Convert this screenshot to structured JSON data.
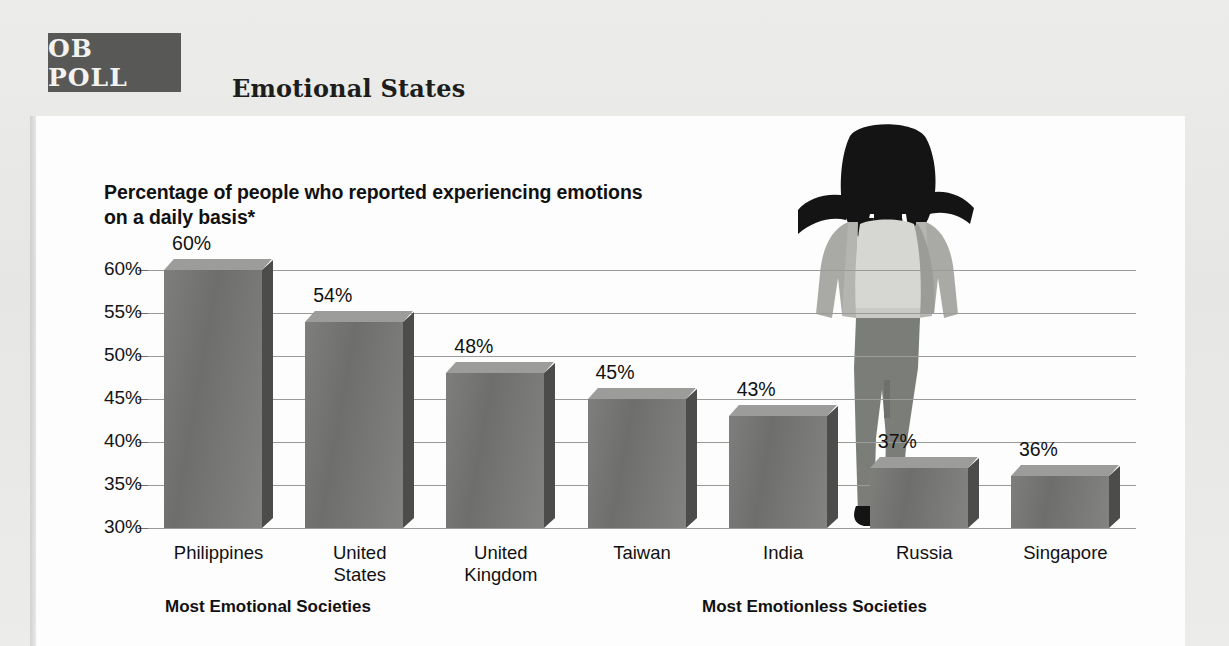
{
  "badge": {
    "label": "OB POLL"
  },
  "header": {
    "title": "Emotional States"
  },
  "chart_data": {
    "type": "bar",
    "title": "Emotional States",
    "subtitle": "Percentage of people who reported experiencing emotions on a daily basis*",
    "categories": [
      "Philippines",
      "United States",
      "United Kingdom",
      "Taiwan",
      "India",
      "Russia",
      "Singapore"
    ],
    "values": [
      60,
      54,
      48,
      45,
      43,
      37,
      36
    ],
    "value_labels": [
      "60%",
      "54%",
      "48%",
      "45%",
      "43%",
      "37%",
      "36%"
    ],
    "xlabel": "",
    "ylabel": "",
    "ylim": [
      30,
      60
    ],
    "ytick_labels": [
      "60%",
      "55%",
      "50%",
      "45%",
      "40%",
      "35%",
      "30%"
    ],
    "ytick_values": [
      60,
      55,
      50,
      45,
      40,
      35,
      30
    ],
    "grid": true,
    "legend": "none",
    "groups": [
      {
        "label": "Most Emotional Societies",
        "categories": [
          "Philippines",
          "United States",
          "United Kingdom"
        ]
      },
      {
        "label": "Most Emotionless Societies",
        "categories": [
          "Taiwan",
          "India",
          "Russia",
          "Singapore"
        ]
      }
    ],
    "annotations": [
      "stressed-woman-silhouette"
    ],
    "footnote_marker": "*"
  },
  "colors": {
    "bar_front": "#74746f",
    "bar_top": "#9c9c9a",
    "bar_side": "#4c4c4a",
    "badge_bg": "#585856",
    "gridline": "#9a9a98",
    "panel_bg": "#fdfdfd",
    "page_bg": "#e9e9e7"
  }
}
